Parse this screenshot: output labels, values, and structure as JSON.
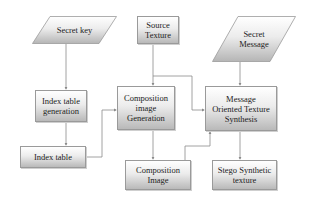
{
  "diagram": {
    "nodes": [
      {
        "id": "secret-key",
        "label": "Secret key",
        "shape": "parallelogram"
      },
      {
        "id": "source-texture",
        "label": "Source Texture",
        "lines": [
          "Source",
          "Texture"
        ],
        "shape": "rectangle"
      },
      {
        "id": "secret-message",
        "label": "Secret Message",
        "lines": [
          "Secret",
          "Message"
        ],
        "shape": "parallelogram"
      },
      {
        "id": "index-table-generation",
        "label": "Index table generation",
        "lines": [
          "Index table",
          "generation"
        ],
        "shape": "rectangle"
      },
      {
        "id": "composition-image-generation",
        "label": "Composition image Generation",
        "lines": [
          "Composition",
          "image",
          "Generation"
        ],
        "shape": "rectangle"
      },
      {
        "id": "message-oriented-texture-synthesis",
        "label": "Message Oriented Texture Synthesis",
        "lines": [
          "Message",
          "Oriented Texture",
          "Synthesis"
        ],
        "shape": "rectangle"
      },
      {
        "id": "index-table",
        "label": "Index table",
        "shape": "rectangle"
      },
      {
        "id": "composition-image",
        "label": "Composition Image",
        "lines": [
          "Composition",
          "Image"
        ],
        "shape": "rectangle"
      },
      {
        "id": "stego-synthetic-texture",
        "label": "Stego Synthetic texture",
        "lines": [
          "Stego Synthetic",
          "texture"
        ],
        "shape": "rectangle"
      }
    ],
    "edges": [
      {
        "from": "secret-key",
        "to": "index-table-generation"
      },
      {
        "from": "index-table-generation",
        "to": "index-table"
      },
      {
        "from": "index-table",
        "to": "composition-image-generation"
      },
      {
        "from": "source-texture",
        "to": "composition-image-generation"
      },
      {
        "from": "source-texture",
        "to": "message-oriented-texture-synthesis"
      },
      {
        "from": "secret-message",
        "to": "message-oriented-texture-synthesis"
      },
      {
        "from": "composition-image-generation",
        "to": "composition-image"
      },
      {
        "from": "composition-image",
        "to": "message-oriented-texture-synthesis"
      },
      {
        "from": "message-oriented-texture-synthesis",
        "to": "stego-synthetic-texture"
      }
    ],
    "colors": {
      "line": "#8a8a8a",
      "border": "#9a9a9a",
      "fill_top": "#ffffff",
      "fill_bottom": "#b9b9b9",
      "text": "#222222"
    }
  }
}
